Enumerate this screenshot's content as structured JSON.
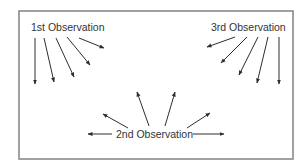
{
  "diagram": {
    "colors": {
      "frame": "#8a8a8a",
      "arrow": "#2e2e2e",
      "text": "#333333",
      "background": "#ffffff"
    },
    "frame": {
      "x": 19,
      "y": 11,
      "width": 274,
      "height": 148
    },
    "labels": {
      "first": {
        "text": "1st Observation",
        "x": 31,
        "y": 31
      },
      "third": {
        "text": "3rd Observation",
        "x": 211,
        "y": 31
      },
      "second": {
        "text": "2nd Observation",
        "x": 116,
        "y": 138
      }
    },
    "groups": [
      {
        "name": "1st Observation",
        "position": "top-left",
        "arrows": [
          {
            "x1": 35,
            "y1": 38,
            "x2": 35,
            "y2": 84
          },
          {
            "x1": 44,
            "y1": 38,
            "x2": 54,
            "y2": 82
          },
          {
            "x1": 56,
            "y1": 38,
            "x2": 74,
            "y2": 77
          },
          {
            "x1": 67,
            "y1": 37,
            "x2": 90,
            "y2": 65
          },
          {
            "x1": 79,
            "y1": 38,
            "x2": 104,
            "y2": 48
          }
        ]
      },
      {
        "name": "3rd Observation",
        "position": "top-right",
        "arrows": [
          {
            "x1": 279,
            "y1": 37,
            "x2": 279,
            "y2": 84
          },
          {
            "x1": 268,
            "y1": 37,
            "x2": 257,
            "y2": 83
          },
          {
            "x1": 258,
            "y1": 37,
            "x2": 239,
            "y2": 75
          },
          {
            "x1": 247,
            "y1": 37,
            "x2": 221,
            "y2": 63
          },
          {
            "x1": 235,
            "y1": 37,
            "x2": 207,
            "y2": 47
          }
        ]
      },
      {
        "name": "2nd Observation",
        "position": "bottom-center",
        "arrows": [
          {
            "x1": 112,
            "y1": 134,
            "x2": 88,
            "y2": 134
          },
          {
            "x1": 128,
            "y1": 128,
            "x2": 103,
            "y2": 114
          },
          {
            "x1": 149,
            "y1": 126,
            "x2": 137,
            "y2": 92
          },
          {
            "x1": 165,
            "y1": 126,
            "x2": 175,
            "y2": 92
          },
          {
            "x1": 187,
            "y1": 128,
            "x2": 210,
            "y2": 113
          },
          {
            "x1": 193,
            "y1": 134,
            "x2": 224,
            "y2": 134
          }
        ]
      }
    ]
  }
}
